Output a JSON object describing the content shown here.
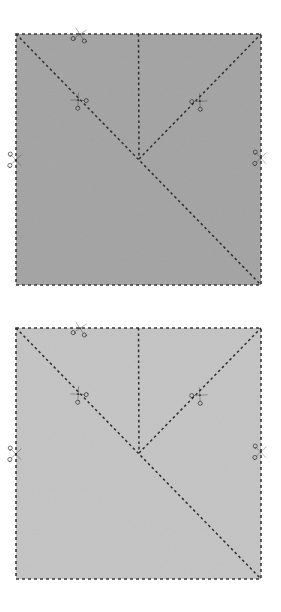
{
  "diagram": {
    "type": "fold-cut-instruction",
    "canvas": {
      "width": 281,
      "height": 612,
      "background": "#ffffff"
    },
    "panels": [
      {
        "id": "panel-top",
        "label": "Step 1 — darker folded square",
        "paper_color": "#a3a3a3",
        "paper_shade_name": "medium-gray",
        "border_color": "#3a3a3a",
        "border_style": "dashed",
        "square": {
          "x": 16,
          "y": 34,
          "width": 245,
          "height": 251
        },
        "fold_lines": [
          {
            "name": "main-diagonal-fold",
            "from": "top-left-corner",
            "to": "bottom-right-corner",
            "style": "dashed"
          },
          {
            "name": "vertical-center-fold",
            "from": "top-edge-midpoint",
            "to": "center-vertex",
            "style": "dashed"
          },
          {
            "name": "right-diagonal-fold",
            "from": "center-vertex",
            "to": "top-right-corner",
            "style": "dashed"
          }
        ],
        "center_vertex": {
          "x": 139,
          "y": 159
        },
        "cut_markers": [
          {
            "name": "cut-marker-top-edge",
            "x": 80,
            "y": 34,
            "rotation": 12,
            "on": "top-edge"
          },
          {
            "name": "cut-marker-left-diagonal",
            "x": 78,
            "y": 100,
            "rotation": -42,
            "on": "main-diagonal-fold"
          },
          {
            "name": "cut-marker-right-diagonal",
            "x": 200,
            "y": 101,
            "rotation": 42,
            "on": "right-diagonal-fold"
          },
          {
            "name": "cut-marker-left-edge",
            "x": 16,
            "y": 160,
            "rotation": 92,
            "on": "left-edge"
          },
          {
            "name": "cut-marker-right-edge",
            "x": 261,
            "y": 158,
            "rotation": 92,
            "on": "right-edge"
          }
        ]
      },
      {
        "id": "panel-bottom",
        "label": "Step 2 — lighter folded square",
        "paper_color": "#c4c4c4",
        "paper_shade_name": "light-gray",
        "border_color": "#3a3a3a",
        "border_style": "dashed",
        "square": {
          "x": 16,
          "y": 22,
          "width": 245,
          "height": 251
        },
        "fold_lines": [
          {
            "name": "main-diagonal-fold",
            "from": "top-left-corner",
            "to": "bottom-right-corner",
            "style": "dashed"
          },
          {
            "name": "vertical-center-fold",
            "from": "top-edge-midpoint",
            "to": "center-vertex",
            "style": "dashed"
          },
          {
            "name": "right-diagonal-fold",
            "from": "center-vertex",
            "to": "top-right-corner",
            "style": "dashed"
          }
        ],
        "center_vertex": {
          "x": 139,
          "y": 147
        },
        "cut_markers": [
          {
            "name": "cut-marker-top-edge",
            "x": 80,
            "y": 22,
            "rotation": 12,
            "on": "top-edge"
          },
          {
            "name": "cut-marker-left-diagonal",
            "x": 78,
            "y": 88,
            "rotation": -42,
            "on": "main-diagonal-fold"
          },
          {
            "name": "cut-marker-right-diagonal",
            "x": 200,
            "y": 89,
            "rotation": 42,
            "on": "right-diagonal-fold"
          },
          {
            "name": "cut-marker-left-edge",
            "x": 16,
            "y": 148,
            "rotation": 92,
            "on": "left-edge"
          },
          {
            "name": "cut-marker-right-edge",
            "x": 261,
            "y": 146,
            "rotation": 92,
            "on": "right-edge"
          }
        ]
      }
    ],
    "icon_names": {
      "cut_marker": "scissors-icon"
    }
  }
}
